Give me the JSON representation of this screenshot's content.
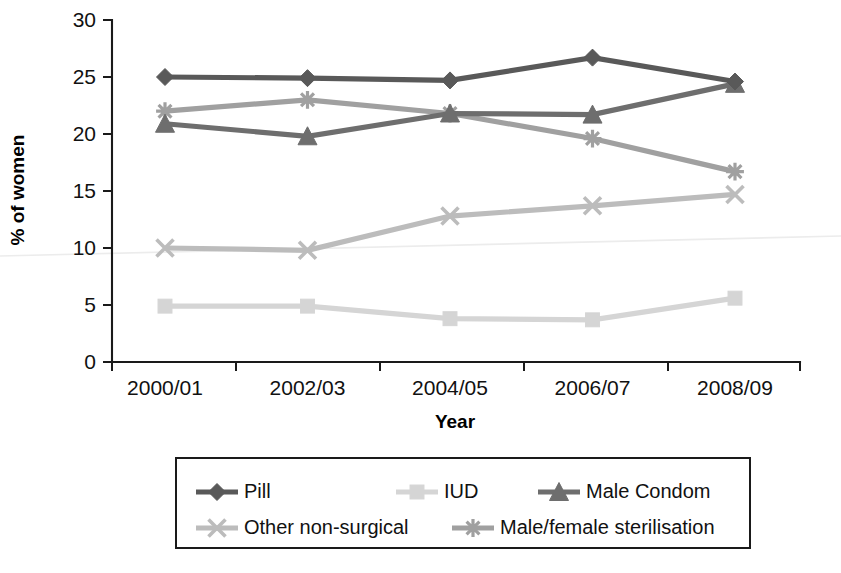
{
  "chart_data": {
    "type": "line",
    "title": "",
    "xlabel": "Year",
    "ylabel": "% of women",
    "categories": [
      "2000/01",
      "2002/03",
      "2004/05",
      "2006/07",
      "2008/09"
    ],
    "ylim": [
      0,
      30
    ],
    "yticks": [
      0,
      5,
      10,
      15,
      20,
      25,
      30
    ],
    "ytick_labels": [
      "0",
      "5",
      "10",
      "15",
      "20",
      "25",
      "30"
    ],
    "grid": false,
    "legend_position": "bottom",
    "series": [
      {
        "name": "Pill",
        "marker": "diamond",
        "color": "#595959",
        "values": [
          25.0,
          24.9,
          24.7,
          26.7,
          24.6
        ]
      },
      {
        "name": "IUD",
        "marker": "square",
        "color": "#d5d5d5",
        "values": [
          4.9,
          4.9,
          3.8,
          3.7,
          5.6
        ]
      },
      {
        "name": "Male Condom",
        "marker": "triangle",
        "color": "#6e6e6e",
        "values": [
          20.9,
          19.8,
          21.8,
          21.7,
          24.4
        ]
      },
      {
        "name": "Other non-surgical",
        "marker": "x",
        "color": "#bcbcbc",
        "values": [
          10.0,
          9.8,
          12.8,
          13.7,
          14.7
        ]
      },
      {
        "name": "Male/female sterilisation",
        "marker": "asterisk",
        "color": "#a0a0a0",
        "values": [
          22.0,
          23.0,
          21.8,
          19.6,
          16.7
        ]
      }
    ]
  },
  "legend": {
    "entries": [
      {
        "label": "Pill",
        "swatch": "legend-swatch-pill"
      },
      {
        "label": "IUD",
        "swatch": "legend-swatch-iud"
      },
      {
        "label": "Male Condom",
        "swatch": "legend-swatch-male-condom"
      },
      {
        "label": "Other non-surgical",
        "swatch": "legend-swatch-other-non-surgical"
      },
      {
        "label": "Male/female sterilisation",
        "swatch": "legend-swatch-male-female-sterilisation"
      }
    ]
  },
  "axes": {
    "y_title": "% of women",
    "x_title": "Year"
  }
}
